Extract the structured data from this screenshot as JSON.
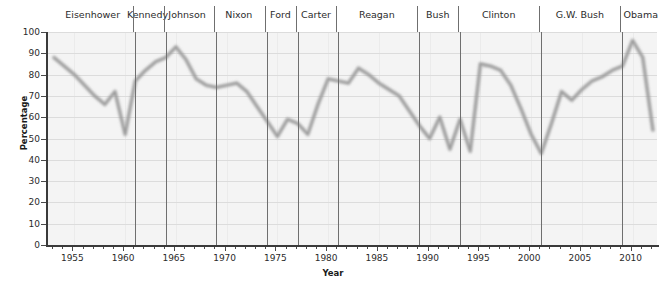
{
  "chart_data": {
    "type": "line",
    "title": "",
    "xlabel": "Year",
    "ylabel": "Percentage",
    "xlim": [
      1952.4,
      2012.6
    ],
    "ylim": [
      0,
      100
    ],
    "grid": true,
    "legend": false,
    "y_ticks": [
      0,
      10,
      20,
      30,
      40,
      50,
      60,
      70,
      80,
      90,
      100
    ],
    "x_ticks": [
      1955,
      1960,
      1965,
      1970,
      1975,
      1980,
      1985,
      1990,
      1995,
      2000,
      2005,
      2010
    ],
    "x_tick_step_minor": 1,
    "line_color": "#9a9a9a",
    "plot_background": "#f4f4f4",
    "series": [
      {
        "name": "Percentage",
        "x": [
          1953,
          1954,
          1955,
          1956,
          1957,
          1958,
          1959,
          1960,
          1961,
          1962,
          1963,
          1964,
          1965,
          1966,
          1967,
          1968,
          1969,
          1970,
          1971,
          1972,
          1973,
          1974,
          1975,
          1976,
          1977,
          1978,
          1979,
          1980,
          1981,
          1982,
          1983,
          1984,
          1985,
          1986,
          1987,
          1988,
          1989,
          1990,
          1991,
          1992,
          1993,
          1994,
          1995,
          1996,
          1997,
          1998,
          1999,
          2000,
          2001,
          2002,
          2003,
          2004,
          2005,
          2006,
          2007,
          2008,
          2009,
          2010,
          2011,
          2012
        ],
        "y": [
          88,
          84,
          80,
          75,
          70,
          66,
          72,
          52,
          77,
          82,
          86,
          88,
          93,
          87,
          78,
          75,
          74,
          75,
          76,
          72,
          65,
          58,
          51,
          59,
          57,
          52,
          66,
          78,
          77,
          76,
          83,
          80,
          76,
          73,
          70,
          63,
          56,
          50,
          60,
          45,
          59,
          44,
          85,
          84,
          82,
          75,
          64,
          52,
          43,
          57,
          72,
          68,
          73,
          77,
          79,
          82,
          84,
          96,
          88,
          54
        ]
      }
    ],
    "term_dividers": [
      1961,
      1964,
      1969,
      1974,
      1977,
      1981,
      1989,
      1993,
      2001,
      2009
    ],
    "presidents": [
      {
        "name": "Eisenhower",
        "center_year": 1957
      },
      {
        "name": "Kennedy",
        "center_year": 1962.4
      },
      {
        "name": "Johnson",
        "center_year": 1966.3
      },
      {
        "name": "Nixon",
        "center_year": 1971.4
      },
      {
        "name": "Ford",
        "center_year": 1975.5
      },
      {
        "name": "Carter",
        "center_year": 1979
      },
      {
        "name": "Reagan",
        "center_year": 1985
      },
      {
        "name": "Bush",
        "center_year": 1991
      },
      {
        "name": "Clinton",
        "center_year": 1997
      },
      {
        "name": "G.W. Bush",
        "center_year": 2005
      },
      {
        "name": "Obama",
        "center_year": 2011
      }
    ]
  }
}
